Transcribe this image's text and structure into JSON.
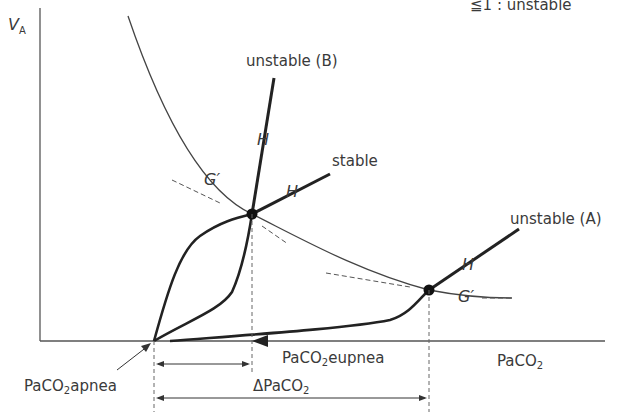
{
  "figure": {
    "top_right_partial": "≦1 : unstable",
    "y_axis_label_main": "V",
    "y_axis_label_sub": "A",
    "x_axis_label_main": "PaCO",
    "x_axis_label_sub": "2",
    "labels": {
      "unstable_b": "unstable (B)",
      "stable": "stable",
      "unstable_a": "unstable (A)",
      "h": "H",
      "g_prime": "G′",
      "apnea_main": "PaCO",
      "apnea_sub": "2",
      "apnea_suffix": "apnea",
      "eupnea_main": "PaCO",
      "eupnea_sub": "2",
      "eupnea_suffix": "eupnea",
      "delta_main": "ΔPaCO",
      "delta_sub": "2"
    },
    "colors": {
      "line": "#222222",
      "thin_line": "#555555",
      "text": "#3a3a3a"
    }
  }
}
